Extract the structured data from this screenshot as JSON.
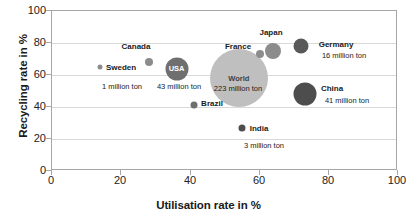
{
  "chart_data": {
    "type": "scatter",
    "title": "",
    "xlabel": "Utilisation rate in %",
    "ylabel": "Recycling rate in %",
    "xlim": [
      0,
      100
    ],
    "ylim": [
      0,
      100
    ],
    "xticks": [
      "0",
      "20",
      "40",
      "60",
      "80",
      "100"
    ],
    "yticks": [
      "0",
      "20",
      "40",
      "60",
      "80",
      "100"
    ],
    "grid": "horizontal",
    "legend": "none",
    "bubble_size_meaning": "volume in million ton",
    "points": [
      {
        "name": "Sweden",
        "x": 14,
        "y": 65,
        "size_label": "1 million ton",
        "size_value": 1,
        "radius_px": 2.5,
        "color": "#8c8c8c",
        "label_inside": "",
        "name_left": 121,
        "name_top": 68,
        "value_left": 122,
        "value_top": 87
      },
      {
        "name": "Canada",
        "x": 28,
        "y": 68,
        "size_label": "",
        "size_value": 4,
        "radius_px": 4,
        "color": "#8c8c8c",
        "label_inside": "",
        "name_left": 136,
        "name_top": 47,
        "value_left": 0,
        "value_top": 0
      },
      {
        "name": "USA",
        "x": 36,
        "y": 64,
        "size_label": "43 million ton",
        "size_value": 43,
        "radius_px": 11.5,
        "color": "#6f6f6f",
        "label_inside": "USA",
        "name_left": 0,
        "name_top": 0,
        "value_left": 179,
        "value_top": 87
      },
      {
        "name": "World",
        "x": 54,
        "y": 58,
        "size_label": "223 million ton",
        "size_value": 223,
        "radius_px": 29,
        "color": "#bfbfbf",
        "label_inside": "World",
        "name_left": 0,
        "name_top": 0,
        "value_left": 238,
        "value_top": 89
      },
      {
        "name": "France",
        "x": 60,
        "y": 73,
        "size_label": "",
        "size_value": 3,
        "radius_px": 4,
        "color": "#8c8c8c",
        "label_inside": "",
        "name_left": 238,
        "name_top": 47,
        "value_left": 0,
        "value_top": 0
      },
      {
        "name": "Japan",
        "x": 64,
        "y": 75,
        "size_label": "",
        "size_value": 12,
        "radius_px": 8,
        "color": "#8c8c8c",
        "label_inside": "",
        "name_left": 271,
        "name_top": 33,
        "value_left": 0,
        "value_top": 0
      },
      {
        "name": "Germany",
        "x": 72,
        "y": 78,
        "size_label": "16 million ton",
        "size_value": 16,
        "radius_px": 7.5,
        "color": "#595959",
        "label_inside": "",
        "name_left": 336,
        "name_top": 45,
        "value_left": 344,
        "value_top": 56
      },
      {
        "name": "China",
        "x": 73,
        "y": 48,
        "size_label": "41 million ton",
        "size_value": 41,
        "radius_px": 11.5,
        "color": "#4d4d4d",
        "label_inside": "",
        "name_left": 332,
        "name_top": 89,
        "value_left": 347,
        "value_top": 101
      },
      {
        "name": "Brazil",
        "x": 41,
        "y": 41,
        "size_label": "",
        "size_value": 3,
        "radius_px": 3.5,
        "color": "#6f6f6f",
        "label_inside": "",
        "name_left": 212,
        "name_top": 104,
        "value_left": 0,
        "value_top": 0
      },
      {
        "name": "India",
        "x": 55,
        "y": 27,
        "size_label": "3 million ton",
        "size_value": 3,
        "radius_px": 3.5,
        "color": "#4d4d4d",
        "label_inside": "",
        "name_left": 259,
        "name_top": 129,
        "value_left": 264,
        "value_top": 146
      }
    ]
  },
  "axes": {
    "x_title": "Utilisation rate in %",
    "y_title": "Recycling rate in %",
    "x_tick_labels": [
      "0",
      "20",
      "40",
      "60",
      "80",
      "100"
    ],
    "y_tick_labels": [
      "0",
      "20",
      "40",
      "60",
      "80",
      "100"
    ]
  },
  "colors": {
    "plot_border": "#a6a6a6",
    "gridline": "#d9d9d9",
    "background": "#ffffff",
    "text": "#1a1a1a"
  }
}
